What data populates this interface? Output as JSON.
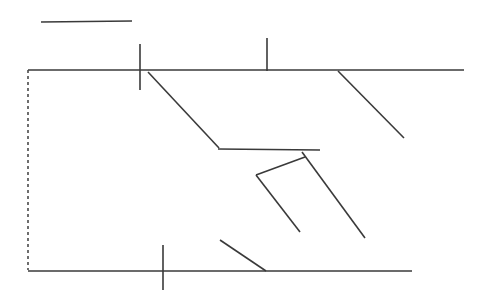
{
  "figure": {
    "canvas": {
      "width": 482,
      "height": 308,
      "background": "#ffffff"
    },
    "stroke_color": "#3a3a3a",
    "stroke_color_light": "#4a4a4a",
    "stroke_width": 1.6,
    "dash_pattern": "3 3",
    "elements": [
      {
        "name": "top-left-short-line",
        "kind": "line",
        "x1": 41,
        "y1": 22,
        "x2": 132,
        "y2": 21,
        "style": "solid",
        "width": 1.6,
        "color": "#3a3a3a"
      },
      {
        "name": "upper-vertical-tick-left",
        "kind": "line",
        "x1": 140,
        "y1": 44,
        "x2": 140,
        "y2": 90,
        "style": "solid",
        "width": 1.6,
        "color": "#3a3a3a"
      },
      {
        "name": "upper-vertical-tick-right",
        "kind": "line",
        "x1": 267,
        "y1": 38,
        "x2": 267,
        "y2": 71,
        "style": "solid",
        "width": 1.6,
        "color": "#3a3a3a"
      },
      {
        "name": "top-horizontal-line",
        "kind": "line",
        "x1": 28,
        "y1": 70,
        "x2": 464,
        "y2": 70,
        "style": "solid",
        "width": 1.6,
        "color": "#3a3a3a"
      },
      {
        "name": "left-dashed-vertical-line",
        "kind": "line",
        "x1": 28,
        "y1": 70,
        "x2": 28,
        "y2": 270,
        "style": "dashed",
        "width": 1.6,
        "color": "#4a4a4a"
      },
      {
        "name": "upper-left-diagonal",
        "kind": "line",
        "x1": 148,
        "y1": 72,
        "x2": 219,
        "y2": 148,
        "style": "solid",
        "width": 1.6,
        "color": "#3a3a3a"
      },
      {
        "name": "upper-right-diagonal",
        "kind": "line",
        "x1": 338,
        "y1": 71,
        "x2": 404,
        "y2": 138,
        "style": "solid",
        "width": 1.6,
        "color": "#3a3a3a"
      },
      {
        "name": "middle-horizontal-line",
        "kind": "line",
        "x1": 218,
        "y1": 149,
        "x2": 320,
        "y2": 150,
        "style": "solid",
        "width": 1.6,
        "color": "#3a3a3a"
      },
      {
        "name": "center-long-diagonal",
        "kind": "line",
        "x1": 302,
        "y1": 152,
        "x2": 365,
        "y2": 238,
        "style": "solid",
        "width": 1.6,
        "color": "#3a3a3a"
      },
      {
        "name": "zigzag-upper-segment",
        "kind": "line",
        "x1": 305,
        "y1": 157,
        "x2": 256,
        "y2": 175,
        "style": "solid",
        "width": 1.6,
        "color": "#3a3a3a"
      },
      {
        "name": "zigzag-lower-segment",
        "kind": "line",
        "x1": 256,
        "y1": 175,
        "x2": 300,
        "y2": 232,
        "style": "solid",
        "width": 1.6,
        "color": "#3a3a3a"
      },
      {
        "name": "bottom-diagonal",
        "kind": "line",
        "x1": 220,
        "y1": 240,
        "x2": 266,
        "y2": 271,
        "style": "solid",
        "width": 1.6,
        "color": "#3a3a3a"
      },
      {
        "name": "bottom-vertical-tick",
        "kind": "line",
        "x1": 163,
        "y1": 245,
        "x2": 163,
        "y2": 290,
        "style": "solid",
        "width": 1.6,
        "color": "#3a3a3a"
      },
      {
        "name": "bottom-horizontal-line",
        "kind": "line",
        "x1": 28,
        "y1": 271,
        "x2": 412,
        "y2": 271,
        "style": "solid",
        "width": 1.6,
        "color": "#3a3a3a"
      }
    ]
  }
}
